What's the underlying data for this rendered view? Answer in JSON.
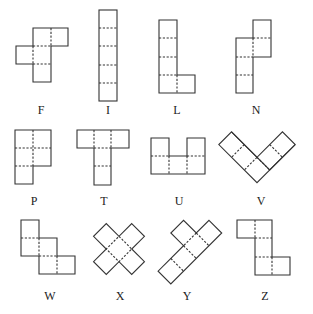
{
  "cell_size": 18,
  "stroke_color": "#333333",
  "pentominoes": [
    {
      "name": "F",
      "label": "F"
    },
    {
      "name": "I",
      "label": "I"
    },
    {
      "name": "L",
      "label": "L"
    },
    {
      "name": "N",
      "label": "N"
    },
    {
      "name": "P",
      "label": "P"
    },
    {
      "name": "T",
      "label": "T"
    },
    {
      "name": "U",
      "label": "U"
    },
    {
      "name": "V",
      "label": "V"
    },
    {
      "name": "W",
      "label": "W"
    },
    {
      "name": "X",
      "label": "X"
    },
    {
      "name": "Y",
      "label": "Y"
    },
    {
      "name": "Z",
      "label": "Z"
    }
  ]
}
